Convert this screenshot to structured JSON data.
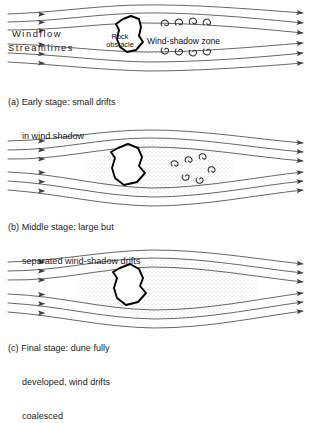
{
  "figure": {
    "colors": {
      "streamline": "#4a4a4a",
      "rock_outline": "#000000",
      "stipple": "#b9b9b9",
      "text": "#1a1a1a",
      "background": "#ffffff"
    }
  },
  "labels": {
    "windflow": "Windflow",
    "streamlines": "Streamlines",
    "rock_line1": "Rock",
    "rock_line2": "obstacle",
    "wind_shadow_zone": "Wind-shadow zone"
  },
  "panels": [
    {
      "id": "a",
      "marker": "(a)",
      "caption_line1": "Early stage: small drifts",
      "caption_line2": "in wind shadow",
      "caption_line3": "",
      "streamline_count": 6,
      "eddy_count": 8,
      "drift": "small separated drifts in wind shadow"
    },
    {
      "id": "b",
      "marker": "(b)",
      "caption_line1": "Middle stage: large but",
      "caption_line2": "separated wind-shadow drifts",
      "caption_line3": "",
      "streamline_count": 6,
      "eddy_count": 6,
      "drift": "large but separated stippled drift lens"
    },
    {
      "id": "c",
      "marker": "(c)",
      "caption_line1": "Final stage: dune fully",
      "caption_line2": "developed, wind drifts",
      "caption_line3": "coalesced",
      "streamline_count": 6,
      "eddy_count": 0,
      "drift": "fully coalesced dune lens"
    }
  ]
}
